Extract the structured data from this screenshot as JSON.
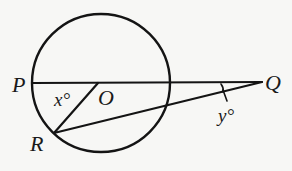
{
  "figure": {
    "type": "geometry",
    "colors": {
      "background": "#f7f7f5",
      "ink": "#141414"
    },
    "points": {
      "P": {
        "label": "P",
        "x": 33,
        "y": 83
      },
      "O": {
        "label": "O",
        "x": 98,
        "y": 83
      },
      "Q": {
        "label": "Q",
        "x": 262,
        "y": 82
      },
      "R": {
        "label": "R",
        "x": 54,
        "y": 133
      }
    },
    "circle": {
      "cx": 101,
      "cy": 83,
      "r": 69
    },
    "angles": {
      "x": {
        "label": "x°",
        "at": "ROP"
      },
      "y": {
        "label": "y°",
        "at": "PQR"
      }
    }
  }
}
